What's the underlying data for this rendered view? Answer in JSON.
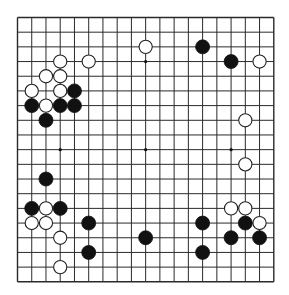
{
  "game": "Go",
  "board_size": 19,
  "colors": {
    "background": "#ffffff",
    "grid_line": "#2a2a2a",
    "black_stone": "#111111",
    "white_stone": "#ffffff",
    "white_stone_outline": "#222222",
    "star_point": "#111111"
  },
  "star_points": [
    [
      3,
      3
    ],
    [
      9,
      3
    ],
    [
      15,
      3
    ],
    [
      3,
      9
    ],
    [
      9,
      9
    ],
    [
      15,
      9
    ],
    [
      3,
      15
    ],
    [
      9,
      15
    ],
    [
      15,
      15
    ]
  ],
  "stones": {
    "black": [
      [
        13,
        2
      ],
      [
        15,
        3
      ],
      [
        4,
        5
      ],
      [
        1,
        6
      ],
      [
        3,
        6
      ],
      [
        4,
        6
      ],
      [
        2,
        7
      ],
      [
        2,
        11
      ],
      [
        1,
        13
      ],
      [
        3,
        13
      ],
      [
        13,
        14
      ],
      [
        5,
        14
      ],
      [
        16,
        14
      ],
      [
        9,
        15
      ],
      [
        15,
        15
      ],
      [
        17,
        15
      ],
      [
        5,
        16
      ],
      [
        13,
        16
      ]
    ],
    "white": [
      [
        9,
        2
      ],
      [
        3,
        3
      ],
      [
        5,
        3
      ],
      [
        17,
        3
      ],
      [
        2,
        4
      ],
      [
        3,
        4
      ],
      [
        1,
        5
      ],
      [
        3,
        5
      ],
      [
        2,
        6
      ],
      [
        16,
        7
      ],
      [
        16,
        10
      ],
      [
        2,
        13
      ],
      [
        15,
        13
      ],
      [
        16,
        13
      ],
      [
        1,
        14
      ],
      [
        2,
        14
      ],
      [
        17,
        14
      ],
      [
        3,
        15
      ],
      [
        3,
        17
      ]
    ]
  }
}
